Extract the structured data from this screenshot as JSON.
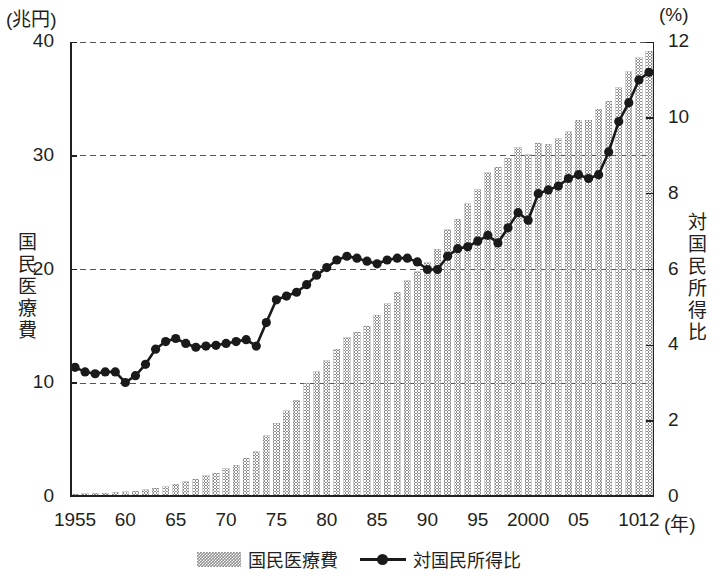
{
  "units": {
    "left": "(兆円)",
    "right": "(%)"
  },
  "axis_titles": {
    "left": "国民医療費",
    "right": "対国民所得比"
  },
  "legend": [
    {
      "key": "bars",
      "label": "国民医療費",
      "marker": "bar-swatch",
      "color": "#8e8e8e"
    },
    {
      "key": "line",
      "label": "対国民所得比",
      "marker": "line-dot-swatch",
      "color": "#1a1a1a"
    }
  ],
  "x_axis_suffix": "(年)",
  "chart_data": {
    "type": "bar",
    "title": "",
    "subtitle": "",
    "xlabel": "(年)",
    "ylabel": "国民医療費",
    "y2label": "対国民所得比",
    "ylim": [
      0,
      40
    ],
    "y2lim": [
      0,
      12
    ],
    "yticks": [
      0,
      10,
      20,
      30,
      40
    ],
    "y2ticks": [
      0,
      2,
      4,
      6,
      8,
      10,
      12
    ],
    "grid": "horizontal-dashed",
    "legend_position": "bottom-center",
    "x": [
      1955,
      1956,
      1957,
      1958,
      1959,
      1960,
      1961,
      1962,
      1963,
      1964,
      1965,
      1966,
      1967,
      1968,
      1969,
      1970,
      1971,
      1972,
      1973,
      1974,
      1975,
      1976,
      1977,
      1978,
      1979,
      1980,
      1981,
      1982,
      1983,
      1984,
      1985,
      1986,
      1987,
      1988,
      1989,
      1990,
      1991,
      1992,
      1993,
      1994,
      1995,
      1996,
      1997,
      1998,
      1999,
      2000,
      2001,
      2002,
      2003,
      2004,
      2005,
      2006,
      2007,
      2008,
      2009,
      2010,
      2011,
      2012
    ],
    "xtick_labels": [
      "1955",
      "60",
      "65",
      "70",
      "75",
      "80",
      "85",
      "90",
      "95",
      "2000",
      "05",
      "10",
      "12"
    ],
    "xtick_values": [
      1955,
      1960,
      1965,
      1970,
      1975,
      1980,
      1985,
      1990,
      1995,
      2000,
      2005,
      2010,
      2012
    ],
    "series": [
      {
        "name": "国民医療費",
        "type": "bar",
        "axis": "left",
        "unit": "兆円",
        "color": "#8e8e8e",
        "values": [
          0.24,
          0.27,
          0.31,
          0.35,
          0.4,
          0.46,
          0.52,
          0.62,
          0.75,
          0.92,
          1.12,
          1.35,
          1.58,
          1.85,
          2.1,
          2.5,
          2.8,
          3.4,
          4.0,
          5.4,
          6.5,
          7.6,
          8.5,
          10.0,
          11.0,
          12.0,
          13.0,
          14.0,
          14.5,
          15.0,
          16.0,
          17.0,
          18.0,
          19.0,
          19.8,
          20.6,
          21.8,
          23.5,
          24.4,
          25.8,
          27.0,
          28.5,
          29.0,
          29.8,
          30.7,
          30.1,
          31.1,
          31.0,
          31.5,
          32.1,
          33.1,
          33.1,
          34.1,
          34.8,
          36.0,
          37.4,
          38.6,
          39.2
        ]
      },
      {
        "name": "対国民所得比",
        "type": "line",
        "axis": "right",
        "unit": "%",
        "color": "#1a1a1a",
        "marker": "circle",
        "values": [
          3.42,
          3.3,
          3.25,
          3.3,
          3.3,
          3.02,
          3.2,
          3.5,
          3.9,
          4.1,
          4.18,
          4.05,
          3.95,
          3.98,
          4.0,
          4.05,
          4.1,
          4.15,
          3.98,
          4.6,
          5.2,
          5.3,
          5.4,
          5.6,
          5.85,
          6.05,
          6.25,
          6.35,
          6.3,
          6.22,
          6.15,
          6.25,
          6.3,
          6.3,
          6.2,
          6.0,
          6.0,
          6.35,
          6.55,
          6.6,
          6.75,
          6.9,
          6.7,
          7.1,
          7.5,
          7.3,
          8.0,
          8.1,
          8.2,
          8.4,
          8.5,
          8.4,
          8.5,
          9.1,
          9.9,
          10.4,
          11.0,
          11.2
        ]
      }
    ]
  }
}
